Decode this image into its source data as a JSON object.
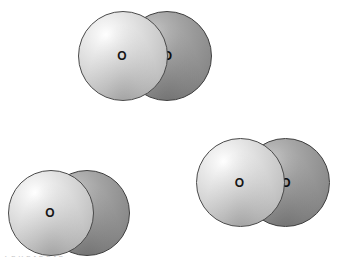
{
  "figure": {
    "background_color": "#ffffff",
    "width": 342,
    "height": 265,
    "footer_fragment": "T e  h   e   t  e  e    t  e"
  },
  "palette": {
    "light_atom_fill": "#d8d8d8",
    "light_atom_highlight": "#ffffff",
    "light_atom_edge": "#4a4a4a",
    "dark_atom_fill": "#989898",
    "dark_atom_highlight": "#c9c9c9",
    "dark_atom_edge": "#3e3e3e",
    "label_color": "#141414"
  },
  "molecules": [
    {
      "id": "molecule-top",
      "name": "oxygen-molecule-top",
      "formula": "O2",
      "atoms": [
        {
          "label": "O",
          "shade": "light",
          "role": "front-atom"
        },
        {
          "label": "O",
          "shade": "dark",
          "role": "back-atom"
        }
      ]
    },
    {
      "id": "molecule-bottom-left",
      "name": "oxygen-molecule-bottom-left",
      "formula": "O2",
      "atoms": [
        {
          "label": "O",
          "shade": "light",
          "role": "front-atom"
        },
        {
          "label": "O",
          "shade": "dark",
          "role": "back-atom"
        }
      ]
    },
    {
      "id": "molecule-bottom-right",
      "name": "oxygen-molecule-bottom-right",
      "formula": "O2",
      "atoms": [
        {
          "label": "O",
          "shade": "light",
          "role": "front-atom"
        },
        {
          "label": "O",
          "shade": "dark",
          "role": "back-atom"
        }
      ]
    }
  ]
}
